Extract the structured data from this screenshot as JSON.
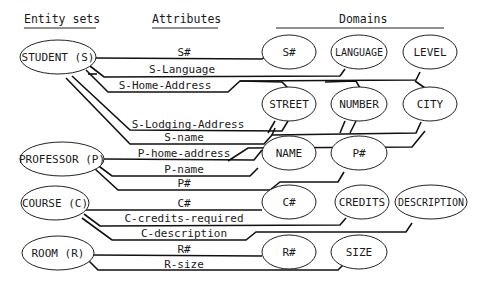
{
  "headers": {
    "entity_sets": "Entity sets",
    "attributes": "Attributes",
    "domains": "Domains"
  },
  "entities": {
    "student": "STUDENT (S)",
    "professor": "PROFESSOR (P)",
    "course": "COURSE (C)",
    "room": "ROOM (R)"
  },
  "attributes": {
    "s_num": "S#",
    "s_language": "S-Language",
    "s_home_address": "S-Home-Address",
    "s_lodging_address": "S-Lodging-Address",
    "s_name": "S-name",
    "p_home_address": "P-home-address",
    "p_name": "P-name",
    "p_num": "P#",
    "c_num": "C#",
    "c_credits_required": "C-credits-required",
    "c_description": "C-description",
    "r_num": "R#",
    "r_size": "R-size"
  },
  "domains": {
    "s_num": "S#",
    "language": "LANGUAGE",
    "level": "LEVEL",
    "street": "STREET",
    "number": "NUMBER",
    "city": "CITY",
    "name": "NAME",
    "p_num": "P#",
    "c_num": "C#",
    "credits": "CREDITS",
    "description": "DESCRIPTION",
    "r_num": "R#",
    "size": "SIZE"
  }
}
